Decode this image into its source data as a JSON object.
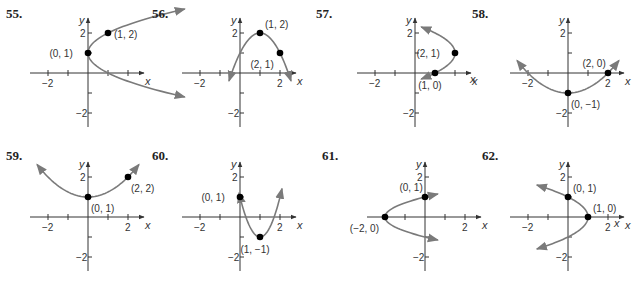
{
  "page": {
    "background": "#ffffff",
    "curve_color": "#7a7a7a",
    "axis_color": "#333333",
    "point_color": "#000000"
  },
  "chart_data": [
    {
      "type": "line",
      "problem": "55.",
      "title": "55.",
      "xlabel": "x",
      "ylabel": "y",
      "xlim": [
        -2.5,
        2.5
      ],
      "ylim": [
        -2.5,
        2.5
      ],
      "x_ticks": [
        -2,
        -1,
        1,
        2
      ],
      "y_ticks": [
        -2,
        -1,
        1,
        2
      ],
      "x_tick_labels": [
        "-2"
      ],
      "y_tick_labels": [
        "2",
        "-2"
      ],
      "curve": "x = (y-1)^2, opening right",
      "vertex": [
        0,
        1
      ],
      "points": [
        {
          "xy": [
            0,
            1
          ],
          "label": "(0, 1)",
          "pos": "left"
        },
        {
          "xy": [
            1,
            2
          ],
          "label": "(1, 2)",
          "pos": "right"
        }
      ],
      "origin_px": [
        88,
        73
      ],
      "unit_px": 20,
      "curve_fn": {
        "kind": "x_of_y",
        "a": 1,
        "h": 0,
        "k": 1,
        "t_range": [
          -1.2,
          3.2
        ]
      }
    },
    {
      "type": "line",
      "problem": "56.",
      "title": "56.",
      "xlabel": "x",
      "ylabel": "y",
      "xlim": [
        -2.5,
        2.5
      ],
      "ylim": [
        -2.5,
        2.5
      ],
      "x_ticks": [
        -2,
        -1,
        1,
        2
      ],
      "y_ticks": [
        -2,
        -1,
        1,
        2
      ],
      "x_tick_labels": [
        "-2",
        "2"
      ],
      "y_tick_labels": [
        "2",
        "-2"
      ],
      "curve": "y = -(x-1)^2 + 2, opening down",
      "vertex": [
        1,
        2
      ],
      "points": [
        {
          "xy": [
            1,
            2
          ],
          "label": "(1, 2)",
          "pos": "upright"
        },
        {
          "xy": [
            2,
            1
          ],
          "label": "(2, 1)",
          "pos": "belowleft"
        }
      ],
      "origin_px": [
        240,
        73
      ],
      "unit_px": 20,
      "curve_fn": {
        "kind": "y_of_x",
        "a": -1,
        "h": 1,
        "k": 2,
        "t_range": [
          -0.55,
          2.55
        ]
      }
    },
    {
      "type": "line",
      "problem": "57.",
      "title": "57.",
      "xlabel": "x",
      "ylabel": "y",
      "xlim": [
        -2.5,
        2.5
      ],
      "ylim": [
        -2.5,
        2.5
      ],
      "x_ticks": [
        -2,
        -1,
        1,
        2
      ],
      "y_ticks": [
        -2,
        -1,
        1,
        2
      ],
      "x_tick_labels": [
        "-2"
      ],
      "y_tick_labels": [
        "2",
        "-2"
      ],
      "curve": "x = -(y-1)^2 + 2, opening left",
      "vertex": [
        2,
        1
      ],
      "points": [
        {
          "xy": [
            2,
            1
          ],
          "label": "(2, 1)",
          "pos": "left"
        },
        {
          "xy": [
            1,
            0
          ],
          "label": "(1, 0)",
          "pos": "below"
        }
      ],
      "origin_px": [
        415,
        73
      ],
      "unit_px": 20,
      "curve_fn": {
        "kind": "x_of_y",
        "a": -1,
        "h": 2,
        "k": 1,
        "t_range": [
          -0.3,
          2.3
        ]
      }
    },
    {
      "type": "line",
      "problem": "58.",
      "title": "58.",
      "xlabel": "x",
      "ylabel": "y",
      "xlim": [
        -2.5,
        2.5
      ],
      "ylim": [
        -2.5,
        2.5
      ],
      "x_ticks": [
        -2,
        -1,
        1,
        2
      ],
      "y_ticks": [
        -2,
        -1,
        1,
        2
      ],
      "x_tick_labels": [
        "-2",
        "2"
      ],
      "y_tick_labels": [
        "2",
        "-2"
      ],
      "curve": "y = x^2/4 - 1, opening up",
      "vertex": [
        0,
        -1
      ],
      "points": [
        {
          "xy": [
            0,
            -1
          ],
          "label": "(0, -1)",
          "pos": "belowright"
        },
        {
          "xy": [
            2,
            0
          ],
          "label": "(2, 0)",
          "pos": "upleft"
        }
      ],
      "origin_px": [
        568,
        73
      ],
      "unit_px": 20,
      "curve_fn": {
        "kind": "y_of_x",
        "a": 0.25,
        "h": 0,
        "k": -1,
        "t_range": [
          -2.55,
          2.55
        ]
      }
    },
    {
      "type": "line",
      "problem": "59.",
      "title": "59.",
      "xlabel": "x",
      "ylabel": "y",
      "xlim": [
        -2.5,
        2.5
      ],
      "ylim": [
        -2.5,
        2.5
      ],
      "x_ticks": [
        -2,
        -1,
        1,
        2
      ],
      "y_ticks": [
        -2,
        -1,
        1,
        2
      ],
      "x_tick_labels": [
        "-2",
        "2"
      ],
      "y_tick_labels": [
        "2",
        "-2"
      ],
      "curve": "y = x^2/4 + 1, opening up",
      "vertex": [
        0,
        1
      ],
      "points": [
        {
          "xy": [
            0,
            1
          ],
          "label": "(0, 1)",
          "pos": "belowright"
        },
        {
          "xy": [
            2,
            2
          ],
          "label": "(2, 2)",
          "pos": "belowright"
        }
      ],
      "origin_px": [
        88,
        217
      ],
      "unit_px": 20,
      "curve_fn": {
        "kind": "y_of_x",
        "a": 0.25,
        "h": 0,
        "k": 1,
        "t_range": [
          -2.55,
          2.55
        ]
      }
    },
    {
      "type": "line",
      "problem": "60.",
      "title": "60.",
      "xlabel": "x",
      "ylabel": "y",
      "xlim": [
        -2.5,
        2.5
      ],
      "ylim": [
        -2.5,
        2.5
      ],
      "x_ticks": [
        -2,
        -1,
        1,
        2
      ],
      "y_ticks": [
        -2,
        -1,
        1,
        2
      ],
      "x_tick_labels": [
        "-2",
        "2"
      ],
      "y_tick_labels": [
        "2",
        "-2"
      ],
      "curve": "y = 2(x-1)^2 - 1, opening up",
      "vertex": [
        1,
        -1
      ],
      "points": [
        {
          "xy": [
            0,
            1
          ],
          "label": "(0, 1)",
          "pos": "left"
        },
        {
          "xy": [
            1,
            -1
          ],
          "label": "(1, -1)",
          "pos": "below"
        }
      ],
      "origin_px": [
        240,
        217
      ],
      "unit_px": 20,
      "curve_fn": {
        "kind": "y_of_x",
        "a": 2,
        "h": 1,
        "k": -1,
        "t_range": [
          -0.05,
          2.1
        ]
      }
    },
    {
      "type": "line",
      "problem": "61.",
      "title": "61.",
      "xlabel": "x",
      "ylabel": "y",
      "xlim": [
        -2.5,
        2.5
      ],
      "ylim": [
        -2.5,
        2.5
      ],
      "x_ticks": [
        -2,
        -1,
        1,
        2
      ],
      "y_ticks": [
        -2,
        -1,
        1,
        2
      ],
      "x_tick_labels": [
        "2"
      ],
      "y_tick_labels": [
        "2",
        "-2"
      ],
      "curve": "x = 2y^2 - 2, opening right",
      "vertex": [
        -2,
        0
      ],
      "points": [
        {
          "xy": [
            -2,
            0
          ],
          "label": "(-2, 0)",
          "pos": "belowleft"
        },
        {
          "xy": [
            0,
            1
          ],
          "label": "(0, 1)",
          "pos": "upleft"
        }
      ],
      "origin_px": [
        425,
        217
      ],
      "unit_px": 20,
      "curve_fn": {
        "kind": "x_of_y",
        "a": 2,
        "h": -2,
        "k": 0,
        "t_range": [
          -1.15,
          1.15
        ]
      }
    },
    {
      "type": "line",
      "problem": "62.",
      "title": "62.",
      "xlabel": "x",
      "ylabel": "y",
      "xlim": [
        -2.5,
        2.5
      ],
      "ylim": [
        -2.5,
        2.5
      ],
      "x_ticks": [
        -2,
        -1,
        1,
        2
      ],
      "y_ticks": [
        -2,
        -1,
        1,
        2
      ],
      "x_tick_labels": [
        "-2",
        "2"
      ],
      "y_tick_labels": [
        "2",
        "-2"
      ],
      "curve": "x = -y^2 + 1, opening left",
      "vertex": [
        1,
        0
      ],
      "points": [
        {
          "xy": [
            0,
            1
          ],
          "label": "(0, 1)",
          "pos": "upright"
        },
        {
          "xy": [
            1,
            0
          ],
          "label": "(1, 0)",
          "pos": "upright"
        }
      ],
      "origin_px": [
        568,
        217
      ],
      "unit_px": 20,
      "curve_fn": {
        "kind": "x_of_y",
        "a": -1,
        "h": 1,
        "k": 0,
        "t_range": [
          -1.6,
          1.6
        ]
      }
    }
  ],
  "extra_labels": [
    {
      "text": "x",
      "x": 470,
      "y": 83,
      "note": "stray x axis label from panel 57 axis end"
    },
    {
      "text": "x",
      "x": 614,
      "y": 227,
      "note": "stray"
    }
  ]
}
